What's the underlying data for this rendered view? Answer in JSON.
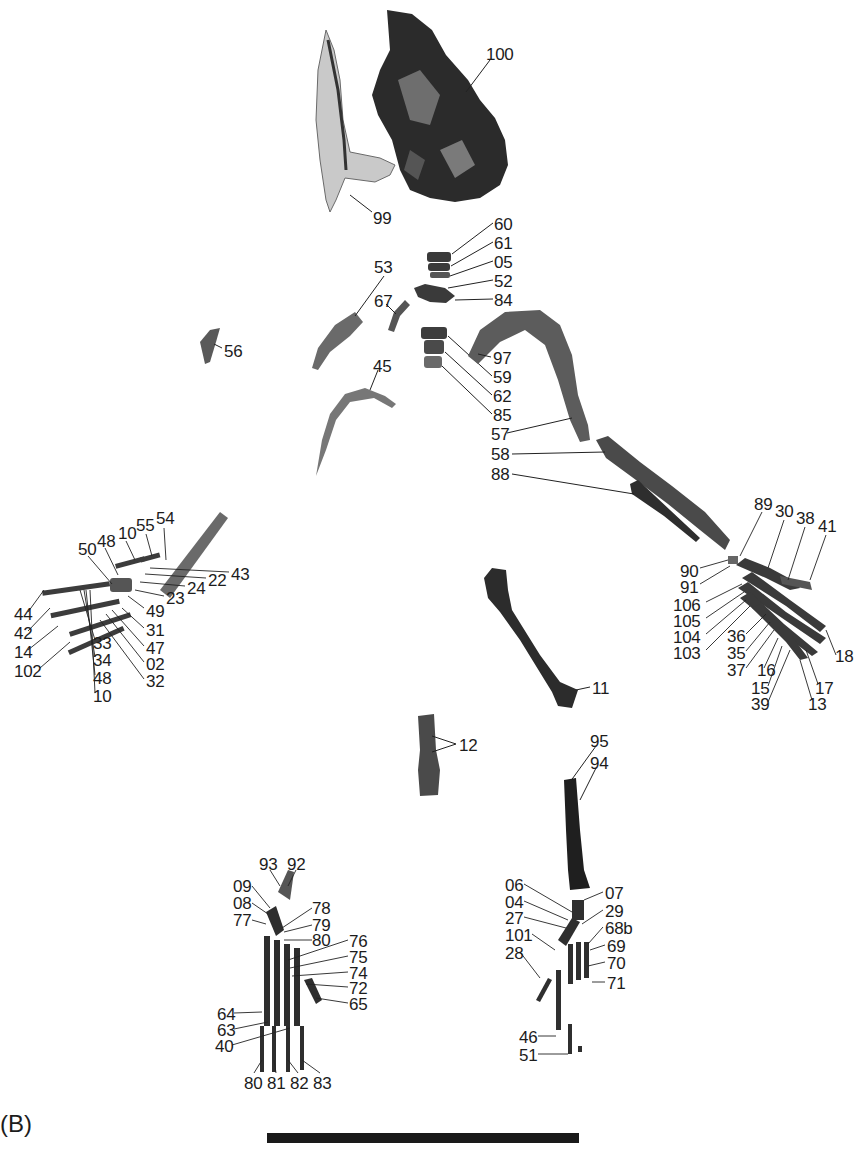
{
  "figure": {
    "panel_label": "(B)",
    "scale_bar": {
      "present": true,
      "label": ""
    }
  },
  "groups": {
    "skull": {
      "labels": [
        "100",
        "99"
      ]
    },
    "vertebrae_ribs": {
      "labels": [
        "60",
        "61",
        "05",
        "52",
        "84",
        "53",
        "67",
        "56",
        "97",
        "59",
        "62",
        "85",
        "45",
        "57",
        "58",
        "88"
      ]
    },
    "left_hand": {
      "labels": [
        "54",
        "55",
        "10",
        "48",
        "50",
        "43",
        "22",
        "24",
        "23",
        "49",
        "44",
        "42",
        "14",
        "102",
        "31",
        "47",
        "02",
        "32",
        "33",
        "34",
        "48",
        "10"
      ]
    },
    "right_hand": {
      "labels": [
        "89",
        "30",
        "38",
        "41",
        "90",
        "91",
        "106",
        "105",
        "104",
        "103",
        "36",
        "35",
        "37",
        "16",
        "15",
        "39",
        "18",
        "17",
        "13"
      ]
    },
    "femur_tibia": {
      "labels": [
        "11",
        "12",
        "95",
        "94"
      ]
    },
    "left_foot": {
      "labels": [
        "93",
        "92",
        "09",
        "08",
        "77",
        "78",
        "79",
        "80",
        "76",
        "75",
        "74",
        "72",
        "65",
        "64",
        "63",
        "40",
        "80",
        "81",
        "82",
        "83"
      ]
    },
    "right_foot": {
      "labels": [
        "06",
        "04",
        "27",
        "101",
        "28",
        "07",
        "29",
        "68b",
        "69",
        "70",
        "71",
        "46",
        "51"
      ]
    }
  },
  "labels": [
    {
      "t": "100",
      "x": 486,
      "y": 46
    },
    {
      "t": "99",
      "x": 373,
      "y": 210
    },
    {
      "t": "60",
      "x": 494,
      "y": 216
    },
    {
      "t": "61",
      "x": 494,
      "y": 235
    },
    {
      "t": "05",
      "x": 494,
      "y": 254
    },
    {
      "t": "52",
      "x": 494,
      "y": 273
    },
    {
      "t": "84",
      "x": 494,
      "y": 292
    },
    {
      "t": "53",
      "x": 374,
      "y": 259
    },
    {
      "t": "67",
      "x": 374,
      "y": 293
    },
    {
      "t": "56",
      "x": 224,
      "y": 343
    },
    {
      "t": "97",
      "x": 493,
      "y": 350
    },
    {
      "t": "59",
      "x": 493,
      "y": 369
    },
    {
      "t": "62",
      "x": 493,
      "y": 388
    },
    {
      "t": "85",
      "x": 493,
      "y": 407
    },
    {
      "t": "45",
      "x": 373,
      "y": 358
    },
    {
      "t": "57",
      "x": 491,
      "y": 426
    },
    {
      "t": "58",
      "x": 491,
      "y": 446
    },
    {
      "t": "88",
      "x": 491,
      "y": 466
    },
    {
      "t": "54",
      "x": 156,
      "y": 510
    },
    {
      "t": "55",
      "x": 136,
      "y": 517
    },
    {
      "t": "10",
      "x": 118,
      "y": 525
    },
    {
      "t": "48",
      "x": 97,
      "y": 533
    },
    {
      "t": "50",
      "x": 78,
      "y": 541
    },
    {
      "t": "43",
      "x": 231,
      "y": 566
    },
    {
      "t": "22",
      "x": 208,
      "y": 572
    },
    {
      "t": "24",
      "x": 187,
      "y": 580
    },
    {
      "t": "23",
      "x": 166,
      "y": 590
    },
    {
      "t": "49",
      "x": 146,
      "y": 603
    },
    {
      "t": "44",
      "x": 14,
      "y": 606
    },
    {
      "t": "42",
      "x": 14,
      "y": 625
    },
    {
      "t": "14",
      "x": 14,
      "y": 644
    },
    {
      "t": "102",
      "x": 14,
      "y": 663
    },
    {
      "t": "31",
      "x": 146,
      "y": 622
    },
    {
      "t": "47",
      "x": 146,
      "y": 640
    },
    {
      "t": "02",
      "x": 146,
      "y": 656
    },
    {
      "t": "32",
      "x": 146,
      "y": 673
    },
    {
      "t": "33",
      "x": 93,
      "y": 635
    },
    {
      "t": "34",
      "x": 93,
      "y": 652
    },
    {
      "t": "48",
      "x": 93,
      "y": 670
    },
    {
      "t": "10",
      "x": 93,
      "y": 688
    },
    {
      "t": "89",
      "x": 754,
      "y": 496
    },
    {
      "t": "30",
      "x": 775,
      "y": 503
    },
    {
      "t": "38",
      "x": 796,
      "y": 510
    },
    {
      "t": "41",
      "x": 818,
      "y": 518
    },
    {
      "t": "90",
      "x": 680,
      "y": 563
    },
    {
      "t": "91",
      "x": 680,
      "y": 579
    },
    {
      "t": "106",
      "x": 673,
      "y": 597
    },
    {
      "t": "105",
      "x": 673,
      "y": 613
    },
    {
      "t": "104",
      "x": 673,
      "y": 629
    },
    {
      "t": "103",
      "x": 673,
      "y": 645
    },
    {
      "t": "36",
      "x": 727,
      "y": 628
    },
    {
      "t": "35",
      "x": 727,
      "y": 645
    },
    {
      "t": "37",
      "x": 727,
      "y": 662
    },
    {
      "t": "16",
      "x": 757,
      "y": 662
    },
    {
      "t": "15",
      "x": 751,
      "y": 680
    },
    {
      "t": "39",
      "x": 751,
      "y": 696
    },
    {
      "t": "18",
      "x": 835,
      "y": 648
    },
    {
      "t": "17",
      "x": 815,
      "y": 680
    },
    {
      "t": "13",
      "x": 808,
      "y": 696
    },
    {
      "t": "11",
      "x": 592,
      "y": 680
    },
    {
      "t": "12",
      "x": 459,
      "y": 737
    },
    {
      "t": "95",
      "x": 590,
      "y": 733
    },
    {
      "t": "94",
      "x": 590,
      "y": 755
    },
    {
      "t": "93",
      "x": 259,
      "y": 856
    },
    {
      "t": "92",
      "x": 287,
      "y": 856
    },
    {
      "t": "09",
      "x": 233,
      "y": 878
    },
    {
      "t": "08",
      "x": 233,
      "y": 895
    },
    {
      "t": "77",
      "x": 233,
      "y": 912
    },
    {
      "t": "78",
      "x": 312,
      "y": 900
    },
    {
      "t": "79",
      "x": 312,
      "y": 917
    },
    {
      "t": "80",
      "x": 312,
      "y": 932
    },
    {
      "t": "76",
      "x": 349,
      "y": 933
    },
    {
      "t": "75",
      "x": 349,
      "y": 949
    },
    {
      "t": "74",
      "x": 349,
      "y": 965
    },
    {
      "t": "72",
      "x": 349,
      "y": 980
    },
    {
      "t": "65",
      "x": 349,
      "y": 996
    },
    {
      "t": "64",
      "x": 217,
      "y": 1006
    },
    {
      "t": "63",
      "x": 217,
      "y": 1022
    },
    {
      "t": "40",
      "x": 215,
      "y": 1038
    },
    {
      "t": "80",
      "x": 244,
      "y": 1075
    },
    {
      "t": "81",
      "x": 267,
      "y": 1075
    },
    {
      "t": "82",
      "x": 290,
      "y": 1075
    },
    {
      "t": "83",
      "x": 313,
      "y": 1075
    },
    {
      "t": "06",
      "x": 505,
      "y": 877
    },
    {
      "t": "04",
      "x": 505,
      "y": 894
    },
    {
      "t": "27",
      "x": 505,
      "y": 910
    },
    {
      "t": "101",
      "x": 505,
      "y": 927
    },
    {
      "t": "28",
      "x": 505,
      "y": 945
    },
    {
      "t": "07",
      "x": 605,
      "y": 885
    },
    {
      "t": "29",
      "x": 605,
      "y": 903
    },
    {
      "t": "68b",
      "x": 605,
      "y": 920
    },
    {
      "t": "69",
      "x": 607,
      "y": 938
    },
    {
      "t": "70",
      "x": 607,
      "y": 955
    },
    {
      "t": "71",
      "x": 607,
      "y": 975
    },
    {
      "t": "46",
      "x": 519,
      "y": 1029
    },
    {
      "t": "51",
      "x": 519,
      "y": 1047
    }
  ],
  "colors": {
    "bone_dark": "#2a2a2a",
    "bone_mid": "#5e5e5e",
    "bone_light": "#bdbdbd",
    "ink": "#1c1c1c"
  }
}
